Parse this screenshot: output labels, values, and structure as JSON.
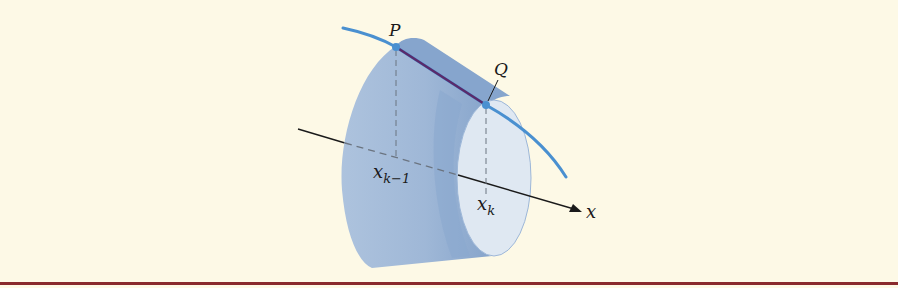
{
  "figure": {
    "labels": {
      "point_p": "P",
      "point_q": "Q",
      "x_k_minus_1_base": "x",
      "x_k_minus_1_sub": "k−1",
      "x_k_base": "x",
      "x_k_sub": "k",
      "axis": "x"
    },
    "colors": {
      "background": "#fdf9e6",
      "frustum_body": "#9db7d8",
      "frustum_shadow": "#7f9fc9",
      "front_face": "#dfe8f2",
      "curve": "#4a90d0",
      "segment_pq": "#5a2a6a",
      "axis": "#1a1a1a",
      "bottom_rule": "#8a2a2e"
    }
  }
}
